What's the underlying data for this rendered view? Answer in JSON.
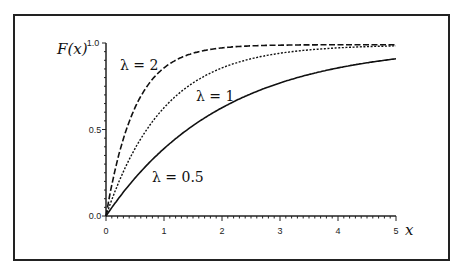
{
  "chart_data": {
    "type": "line",
    "title": "",
    "xlabel": "x",
    "ylabel": "F(x)",
    "xlim": [
      0,
      5
    ],
    "ylim": [
      0,
      1.0
    ],
    "x_ticks": [
      "0",
      "1",
      "2",
      "3",
      "4",
      "5"
    ],
    "y_ticks": [
      "0.0",
      "0.5",
      "1.0"
    ],
    "grid": false,
    "legend": "inline annotations",
    "function": "F(x) = 1 - exp(-lambda x)",
    "series": [
      {
        "name": "λ = 2",
        "lambda": 2,
        "style": "dashed",
        "x": [
          0,
          0.25,
          0.5,
          1,
          1.5,
          2,
          3,
          4,
          5
        ],
        "values": [
          0,
          0.39,
          0.63,
          0.86,
          0.95,
          0.98,
          1.0,
          1.0,
          1.0
        ]
      },
      {
        "name": "λ = 1",
        "lambda": 1,
        "style": "dotted",
        "x": [
          0,
          0.5,
          1,
          1.5,
          2,
          3,
          4,
          5
        ],
        "values": [
          0,
          0.39,
          0.63,
          0.78,
          0.86,
          0.95,
          0.98,
          0.99
        ]
      },
      {
        "name": "λ = 0.5",
        "lambda": 0.5,
        "style": "solid",
        "x": [
          0,
          0.5,
          1,
          2,
          3,
          4,
          5
        ],
        "values": [
          0,
          0.22,
          0.39,
          0.63,
          0.78,
          0.86,
          0.92
        ]
      }
    ],
    "annotations": [
      "λ = 2",
      "λ = 1",
      "λ = 0.5"
    ]
  },
  "labels": {
    "y_axis": "F(x)",
    "x_axis": "x",
    "y_top": "1.0",
    "y_mid": "0.5",
    "y_zero": "0.0",
    "x0": "0",
    "x1": "1",
    "x2": "2",
    "x3": "3",
    "x4": "4",
    "x5": "5",
    "ann_l2": "λ = 2",
    "ann_l1": "λ = 1",
    "ann_l05": "λ = 0.5"
  }
}
